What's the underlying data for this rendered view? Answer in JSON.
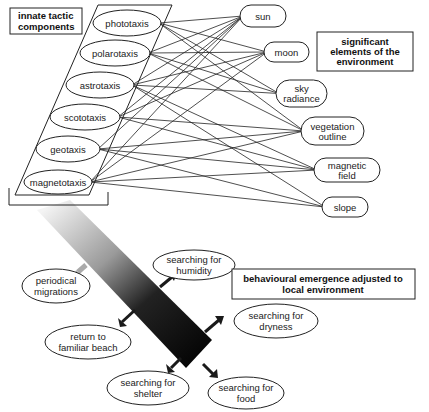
{
  "labels": {
    "innate": [
      "innate tactic",
      "components"
    ],
    "environment": [
      "significant",
      "elements of the",
      "environment"
    ],
    "behaviour": [
      "behavioural emergence adjusted to",
      "local environment"
    ]
  },
  "taxes": [
    {
      "id": "phototaxis",
      "label": "phototaxis",
      "cx": 127,
      "cy": 23,
      "rx": 34,
      "ry": 13
    },
    {
      "id": "polarotaxis",
      "label": "polarotaxis",
      "cx": 115,
      "cy": 53,
      "rx": 35,
      "ry": 13
    },
    {
      "id": "astrotaxis",
      "label": "astrotaxis",
      "cx": 100,
      "cy": 85,
      "rx": 34,
      "ry": 13
    },
    {
      "id": "scototaxis",
      "label": "scototaxis",
      "cx": 85,
      "cy": 117,
      "rx": 35,
      "ry": 13
    },
    {
      "id": "geotaxis",
      "label": "geotaxis",
      "cx": 68,
      "cy": 149,
      "rx": 32,
      "ry": 13
    },
    {
      "id": "magnetotaxis",
      "label": "magnetotaxis",
      "cx": 58,
      "cy": 182,
      "rx": 34,
      "ry": 12
    }
  ],
  "elements": [
    {
      "id": "sun",
      "lines": [
        "sun"
      ],
      "x": 240,
      "y": 5,
      "w": 46,
      "h": 22
    },
    {
      "id": "moon",
      "lines": [
        "moon"
      ],
      "x": 264,
      "y": 42,
      "w": 45,
      "h": 20
    },
    {
      "id": "sky",
      "lines": [
        "sky",
        "radiance"
      ],
      "x": 276,
      "y": 80,
      "w": 51,
      "h": 27
    },
    {
      "id": "vegetation",
      "lines": [
        "vegetation",
        "outline"
      ],
      "x": 301,
      "y": 117,
      "w": 63,
      "h": 28
    },
    {
      "id": "magnetic",
      "lines": [
        "magnetic",
        "field"
      ],
      "x": 314,
      "y": 158,
      "w": 66,
      "h": 24
    },
    {
      "id": "slope",
      "lines": [
        "slope"
      ],
      "x": 322,
      "y": 197,
      "w": 46,
      "h": 20
    }
  ],
  "connections": [
    [
      "phototaxis",
      "sun"
    ],
    [
      "phototaxis",
      "moon"
    ],
    [
      "phototaxis",
      "sky"
    ],
    [
      "phototaxis",
      "vegetation"
    ],
    [
      "polarotaxis",
      "sun"
    ],
    [
      "polarotaxis",
      "moon"
    ],
    [
      "polarotaxis",
      "sky"
    ],
    [
      "polarotaxis",
      "vegetation"
    ],
    [
      "astrotaxis",
      "sun"
    ],
    [
      "astrotaxis",
      "moon"
    ],
    [
      "astrotaxis",
      "sky"
    ],
    [
      "astrotaxis",
      "magnetic"
    ],
    [
      "astrotaxis",
      "slope"
    ],
    [
      "scototaxis",
      "sun"
    ],
    [
      "scototaxis",
      "moon"
    ],
    [
      "scototaxis",
      "vegetation"
    ],
    [
      "scototaxis",
      "magnetic"
    ],
    [
      "geotaxis",
      "sun"
    ],
    [
      "geotaxis",
      "vegetation"
    ],
    [
      "geotaxis",
      "magnetic"
    ],
    [
      "geotaxis",
      "slope"
    ],
    [
      "magnetotaxis",
      "sun"
    ],
    [
      "magnetotaxis",
      "moon"
    ],
    [
      "magnetotaxis",
      "vegetation"
    ],
    [
      "magnetotaxis",
      "magnetic"
    ],
    [
      "magnetotaxis",
      "slope"
    ]
  ],
  "behaviours": [
    {
      "id": "humidity",
      "lines": [
        "searching for",
        "humidity"
      ],
      "cx": 194,
      "cy": 265,
      "rx": 41,
      "ry": 15
    },
    {
      "id": "periodical",
      "lines": [
        "periodical",
        "migrations"
      ],
      "cx": 56,
      "cy": 286,
      "rx": 34,
      "ry": 17
    },
    {
      "id": "dryness",
      "lines": [
        "searching for",
        "dryness"
      ],
      "cx": 276,
      "cy": 321,
      "rx": 42,
      "ry": 17
    },
    {
      "id": "return",
      "lines": [
        "return to",
        "familiar beach"
      ],
      "cx": 88,
      "cy": 342,
      "rx": 43,
      "ry": 17
    },
    {
      "id": "shelter",
      "lines": [
        "searching for",
        "shelter"
      ],
      "cx": 148,
      "cy": 388,
      "rx": 41,
      "ry": 17
    },
    {
      "id": "food",
      "lines": [
        "searching for",
        "food"
      ],
      "cx": 246,
      "cy": 393,
      "rx": 38,
      "ry": 16
    }
  ],
  "arrow": {
    "start": "#f2f2f2",
    "mid": "#888888",
    "end": "#050505"
  }
}
